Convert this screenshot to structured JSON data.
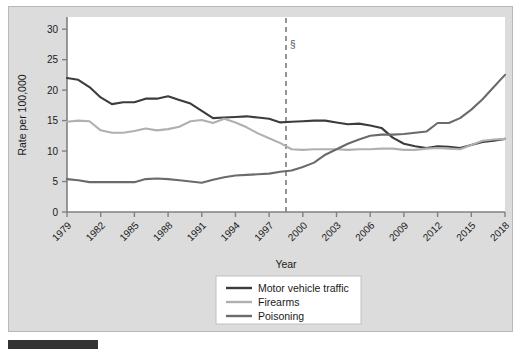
{
  "figure": {
    "background_color": "#dcdcdc",
    "plot_background_color": "#ffffff",
    "bottom_bar_color": "#333333"
  },
  "chart_data": {
    "type": "line",
    "title": "",
    "xlabel": "Year",
    "ylabel": "Rate per 100,000",
    "xlim": [
      1979,
      2018
    ],
    "ylim": [
      0,
      32
    ],
    "yticks": [
      "0",
      "5",
      "10",
      "15",
      "20",
      "25",
      "30"
    ],
    "ytick_values": [
      0,
      5,
      10,
      15,
      20,
      25,
      30
    ],
    "xticks": [
      "1979",
      "1982",
      "1985",
      "1988",
      "1991",
      "1994",
      "1997",
      "2000",
      "2003",
      "2006",
      "2009",
      "2012",
      "2015",
      "2018"
    ],
    "xtick_values": [
      1979,
      1982,
      1985,
      1988,
      1991,
      1994,
      1997,
      2000,
      2003,
      2006,
      2009,
      2012,
      2015,
      2018
    ],
    "grid": false,
    "legend_position": "bottom-center",
    "x": [
      1979,
      1980,
      1981,
      1982,
      1983,
      1984,
      1985,
      1986,
      1987,
      1988,
      1989,
      1990,
      1991,
      1992,
      1993,
      1994,
      1995,
      1996,
      1997,
      1998,
      1999,
      2000,
      2001,
      2002,
      2003,
      2004,
      2005,
      2006,
      2007,
      2008,
      2009,
      2010,
      2011,
      2012,
      2013,
      2014,
      2015,
      2016,
      2017,
      2018
    ],
    "series": [
      {
        "name": "Motor vehicle traffic",
        "color": "#3c3c3c",
        "width": 2.1,
        "values": [
          22.0,
          21.7,
          20.5,
          18.8,
          17.7,
          18.0,
          18.0,
          18.6,
          18.6,
          19.0,
          18.4,
          17.8,
          16.6,
          15.4,
          15.5,
          15.6,
          15.7,
          15.5,
          15.3,
          14.7,
          14.8,
          14.9,
          15.0,
          15.0,
          14.7,
          14.4,
          14.5,
          14.2,
          13.8,
          12.2,
          11.2,
          10.8,
          10.5,
          10.8,
          10.7,
          10.5,
          11.0,
          11.5,
          11.7,
          12.0
        ]
      },
      {
        "name": "Firearms",
        "color": "#b0b0b0",
        "width": 2.1,
        "values": [
          14.8,
          15.0,
          14.9,
          13.4,
          13.0,
          13.0,
          13.3,
          13.7,
          13.4,
          13.6,
          14.0,
          14.9,
          15.1,
          14.6,
          15.3,
          14.7,
          13.9,
          12.9,
          12.1,
          11.3,
          10.3,
          10.2,
          10.3,
          10.3,
          10.3,
          10.2,
          10.3,
          10.3,
          10.4,
          10.4,
          10.2,
          10.2,
          10.4,
          10.5,
          10.4,
          10.3,
          11.0,
          11.7,
          11.9,
          12.0
        ]
      },
      {
        "name": "Poisoning",
        "color": "#6b6b6b",
        "width": 2.1,
        "values": [
          5.4,
          5.2,
          4.9,
          4.9,
          4.9,
          4.9,
          4.9,
          5.4,
          5.5,
          5.4,
          5.2,
          5.0,
          4.8,
          5.3,
          5.7,
          6.0,
          6.1,
          6.2,
          6.3,
          6.6,
          6.8,
          7.4,
          8.1,
          9.4,
          10.3,
          11.2,
          11.9,
          12.5,
          12.7,
          12.7,
          12.8,
          13.0,
          13.2,
          14.6,
          14.6,
          15.4,
          16.8,
          18.5,
          20.5,
          22.5
        ]
      }
    ],
    "annotations": [
      {
        "name": "section-marker",
        "label": "§",
        "x_value": 1998.5,
        "type": "vertical-dashed-line",
        "color": "#7a7a7a"
      }
    ]
  },
  "legend": {
    "items": [
      {
        "label": "Motor vehicle traffic",
        "color": "#3c3c3c"
      },
      {
        "label": "Firearms",
        "color": "#b0b0b0"
      },
      {
        "label": "Poisoning",
        "color": "#6b6b6b"
      }
    ]
  }
}
